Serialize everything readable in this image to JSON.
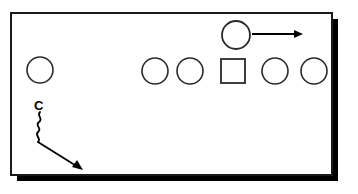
{
  "diagram": {
    "type": "football-play-diagram",
    "background_color": "#ffffff",
    "stroke_color": "#1a1a1a",
    "shadow_color": "#000000",
    "field": {
      "label": "play field frame",
      "x": 11,
      "y": 13,
      "width": 321,
      "height": 162,
      "border_width": 2,
      "shadow_offset": 6
    },
    "players": [
      {
        "id": "player-1",
        "shape": "circle",
        "label": "",
        "cx": 40,
        "cy": 70,
        "r": 13,
        "role": "offensive-lineman-left-wide"
      },
      {
        "id": "player-2",
        "shape": "circle",
        "label": "",
        "cx": 155,
        "cy": 71,
        "r": 13,
        "role": "offensive-lineman"
      },
      {
        "id": "player-3",
        "shape": "circle",
        "label": "",
        "cx": 190,
        "cy": 71,
        "r": 13,
        "role": "offensive-lineman"
      },
      {
        "id": "player-center",
        "shape": "square",
        "label": "",
        "x": 221,
        "y": 59,
        "width": 24,
        "height": 24,
        "role": "center"
      },
      {
        "id": "player-4",
        "shape": "circle",
        "label": "",
        "cx": 275,
        "cy": 71,
        "r": 13,
        "role": "offensive-lineman"
      },
      {
        "id": "player-5",
        "shape": "circle",
        "label": "",
        "cx": 314,
        "cy": 71,
        "r": 13,
        "role": "offensive-lineman"
      },
      {
        "id": "player-motion",
        "shape": "circle",
        "label": "",
        "cx": 236,
        "cy": 35,
        "r": 14,
        "role": "back-in-motion"
      }
    ],
    "labels": [
      {
        "id": "label-c",
        "text": "C",
        "x": 34,
        "y": 110,
        "role": "corner-back-marker"
      }
    ],
    "routes": [
      {
        "id": "route-motion",
        "style": "straight-arrow",
        "from_x": 252,
        "from_y": 34,
        "to_x": 302,
        "to_y": 34,
        "description": "motion to the right"
      },
      {
        "id": "route-c-wavy",
        "style": "wavy-then-straight-arrow",
        "points": "38,113 38,140 82,169",
        "description": "C blitz wavy stem then angled arrow down-right"
      }
    ]
  }
}
